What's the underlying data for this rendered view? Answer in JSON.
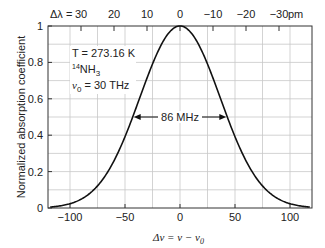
{
  "chart_data": {
    "type": "line",
    "title": "",
    "xlabel": "Δν = ν − ν0",
    "ylabel": "Normalized absorption coefficient",
    "xlim": [
      -120,
      120
    ],
    "ylim": [
      0,
      1
    ],
    "grid": true,
    "x_ticks": [
      -100,
      -50,
      0,
      50,
      100
    ],
    "x_tick_labels": [
      "−100",
      "−50",
      "0",
      "50",
      "100"
    ],
    "y_ticks": [
      0,
      0.2,
      0.4,
      0.6,
      0.8,
      1
    ],
    "y_tick_labels": [
      "0",
      "0.2",
      "0.4",
      "0.6",
      "0.8",
      "1"
    ],
    "top_axis": {
      "prefix": "Δλ =",
      "ticks": [
        30,
        20,
        10,
        0,
        -10,
        -20,
        -30
      ],
      "tick_labels": [
        "30",
        "20",
        "10",
        "0",
        "−10",
        "−20",
        "−30"
      ],
      "unit": "pm",
      "pm_to_dnu_ratio": -3.0
    },
    "series": [
      {
        "name": "Gaussian Doppler profile",
        "shape": "gaussian",
        "center": 0,
        "fwhm": 86,
        "peak": 1
      }
    ],
    "annotations": {
      "params": [
        "T = 273.16 K",
        "14NH3",
        "ν0 = 30 THz"
      ],
      "fwhm_label": "86 MHz",
      "fwhm_value": 86
    }
  },
  "labels": {
    "top_prefix": "Δλ =",
    "top_unit": "pm",
    "temp": "T = 273.16 K",
    "isotope_mass": "14",
    "molecule": "NH",
    "molecule_sub": "3",
    "nu0_symbol": "ν",
    "nu0_sub": "0",
    "nu0_value": " = 30 THz",
    "fwhm": "86 MHz",
    "ylabel": "Normalized absorption coefficient",
    "xlabel_main": "Δν = ν − ν",
    "xlabel_sub": "0"
  }
}
